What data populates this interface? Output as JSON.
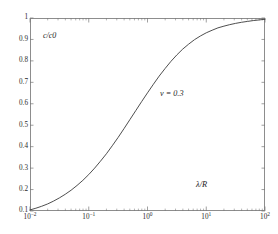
{
  "figure": {
    "background": "#ffffff",
    "frame_color": "#8d8d8d",
    "curve_color": "#3a3a3a",
    "tick_color": "#777777",
    "text_color": "#2b2b2b"
  },
  "annotations": {
    "y_axis_caption": "c/c0",
    "parameter": "ν = 0.3",
    "x_axis_caption": "λ/R"
  },
  "chart_data": {
    "type": "line",
    "title": "",
    "subtitle": "",
    "xlabel": "λ/R",
    "ylabel": "c/c0",
    "xscale": "log",
    "yscale": "linear",
    "xlim": [
      0.01,
      100
    ],
    "ylim": [
      0.1,
      1.0
    ],
    "grid": false,
    "legend": null,
    "x_tick_labels": [
      "10⁻²",
      "10⁻¹",
      "10⁰",
      "10¹",
      "10²"
    ],
    "x_tick_values": [
      0.01,
      0.1,
      1,
      10,
      100
    ],
    "x_tick_mantissa": [
      "10",
      "10",
      "10",
      "10",
      "10"
    ],
    "x_tick_exponent": [
      "-2",
      "-1",
      "0",
      "1",
      "2"
    ],
    "y_tick_labels": [
      "0.1",
      "0.2",
      "0.3",
      "0.4",
      "0.5",
      "0.6",
      "0.7",
      "0.8",
      "0.9",
      "1"
    ],
    "y_tick_values": [
      0.1,
      0.2,
      0.3,
      0.4,
      0.5,
      0.6,
      0.7,
      0.8,
      0.9,
      1.0
    ],
    "annotations": [
      {
        "text": "c/c0",
        "x": 0.022,
        "y": 0.915
      },
      {
        "text": "ν = 0.3",
        "x": 2.2,
        "y": 0.6
      },
      {
        "text": "λ/R",
        "x": 22.0,
        "y": 0.145
      }
    ],
    "series": [
      {
        "name": "c/c0",
        "color": "#3a3a3a",
        "x": [
          0.01,
          0.0126,
          0.0158,
          0.02,
          0.0251,
          0.0316,
          0.0398,
          0.0501,
          0.0631,
          0.0794,
          0.1,
          0.126,
          0.158,
          0.2,
          0.251,
          0.316,
          0.398,
          0.501,
          0.631,
          0.794,
          1.0,
          1.26,
          1.58,
          2.0,
          2.51,
          3.16,
          3.98,
          5.01,
          6.31,
          7.94,
          10.0,
          12.6,
          15.8,
          20.0,
          25.1,
          31.6,
          39.8,
          50.1,
          63.1,
          79.4,
          100.0
        ],
        "y": [
          0.105,
          0.113,
          0.122,
          0.133,
          0.146,
          0.161,
          0.178,
          0.197,
          0.219,
          0.243,
          0.27,
          0.3,
          0.332,
          0.367,
          0.404,
          0.443,
          0.484,
          0.526,
          0.568,
          0.61,
          0.651,
          0.691,
          0.729,
          0.765,
          0.798,
          0.828,
          0.855,
          0.878,
          0.899,
          0.916,
          0.931,
          0.943,
          0.954,
          0.962,
          0.969,
          0.975,
          0.98,
          0.984,
          0.988,
          0.991,
          0.994
        ]
      }
    ]
  }
}
